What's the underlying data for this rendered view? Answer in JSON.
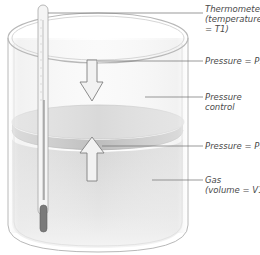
{
  "diagram": {
    "type": "gas-cylinder-piston",
    "colors": {
      "glass_outline": "#b8b8b8",
      "piston_top": "#d9d9d9",
      "piston_edge": "#bdbdbd",
      "gas_fill": "#dcdcdc",
      "arrow_fill": "#f2f2f2",
      "arrow_stroke": "#808080",
      "leader_line": "#6e6e6e",
      "thermometer_bulb": "#7a7a7a",
      "text": "#4a4a4a"
    },
    "labels": {
      "thermometer": {
        "line1": "Thermometer",
        "line2": "(temperature",
        "line3": "= T1)"
      },
      "pressure_top": {
        "line1": "Pressure = P1"
      },
      "pressure_control": {
        "line1": "Pressure",
        "line2": "control"
      },
      "pressure_bottom": {
        "line1": "Pressure = P1"
      },
      "gas": {
        "line1": "Gas",
        "line2": "(volume = V1)"
      }
    }
  }
}
